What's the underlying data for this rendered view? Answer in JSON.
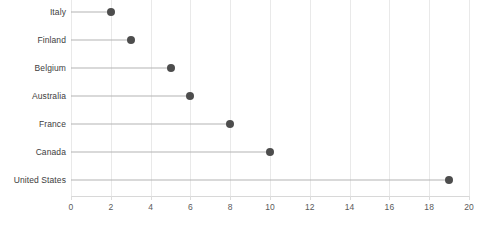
{
  "chart_data": {
    "type": "bar",
    "subtype": "lollipop-horizontal",
    "title": "",
    "subtitle": "",
    "xlabel": "",
    "ylabel": "",
    "categories": [
      "Italy",
      "Finland",
      "Belgium",
      "Australia",
      "France",
      "Canada",
      "United States"
    ],
    "values": [
      2,
      3,
      5,
      6,
      8,
      10,
      19
    ],
    "xlim": [
      0,
      20
    ],
    "xticks": [
      0,
      2,
      4,
      6,
      8,
      10,
      12,
      14,
      16,
      18,
      20
    ],
    "xtick_labels": [
      "0",
      "2",
      "4",
      "6",
      "8",
      "10",
      "12",
      "14",
      "16",
      "18",
      "20"
    ],
    "grid": "vertical",
    "legend": "none",
    "colors": {
      "marker": "#4d4d4d",
      "stem": "#b4b4b4",
      "gridline": "#e9e9e9",
      "axis": "#d8d8d8",
      "tick_text": "#5a5a5a",
      "category_text": "#3d3d3d",
      "background": "#ffffff"
    }
  }
}
